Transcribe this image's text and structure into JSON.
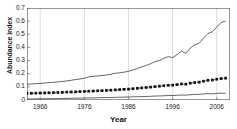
{
  "chart_data": {
    "type": "line",
    "title": "",
    "xlabel": "Year",
    "ylabel": "Abundance index",
    "xlim": [
      1963,
      2009
    ],
    "ylim": [
      0,
      0.7
    ],
    "grid": "vertical-faint",
    "legend": "none",
    "yticks": [
      0,
      0.1,
      0.2,
      0.3,
      0.4,
      0.5,
      0.6,
      0.7
    ],
    "ytick_labels": [
      "0",
      "0.1",
      "0.2",
      "0.3",
      "0.4",
      "0.5",
      "0.6",
      "0.7"
    ],
    "xticks": [
      1966,
      1976,
      1986,
      1996,
      2006
    ],
    "xtick_labels": [
      "1966",
      "1976",
      "1986",
      "1996",
      "2006"
    ],
    "x": [
      1963,
      1964,
      1965,
      1966,
      1967,
      1968,
      1969,
      1970,
      1971,
      1972,
      1973,
      1974,
      1975,
      1976,
      1977,
      1978,
      1979,
      1980,
      1981,
      1982,
      1983,
      1984,
      1985,
      1986,
      1987,
      1988,
      1989,
      1990,
      1991,
      1992,
      1993,
      1994,
      1995,
      1996,
      1997,
      1998,
      1999,
      2000,
      2001,
      2002,
      2003,
      2004,
      2005,
      2006,
      2007,
      2008
    ],
    "series": [
      {
        "name": "upper-confidence-line",
        "style": "thin-solid-line",
        "color": "#3d3d3d",
        "values": [
          0.12,
          0.122,
          0.124,
          0.126,
          0.129,
          0.132,
          0.135,
          0.138,
          0.141,
          0.145,
          0.15,
          0.156,
          0.16,
          0.165,
          0.176,
          0.18,
          0.183,
          0.186,
          0.19,
          0.196,
          0.203,
          0.207,
          0.212,
          0.218,
          0.228,
          0.24,
          0.252,
          0.263,
          0.276,
          0.292,
          0.3,
          0.318,
          0.33,
          0.322,
          0.345,
          0.372,
          0.355,
          0.395,
          0.42,
          0.432,
          0.47,
          0.505,
          0.52,
          0.555,
          0.59,
          0.6
        ]
      },
      {
        "name": "abundance-index-mean",
        "style": "square-markers-dotted",
        "color": "#111111",
        "values": [
          0.05,
          0.051,
          0.052,
          0.053,
          0.054,
          0.055,
          0.056,
          0.057,
          0.058,
          0.06,
          0.061,
          0.062,
          0.064,
          0.065,
          0.067,
          0.068,
          0.07,
          0.071,
          0.073,
          0.075,
          0.077,
          0.079,
          0.081,
          0.083,
          0.086,
          0.089,
          0.092,
          0.095,
          0.098,
          0.102,
          0.105,
          0.109,
          0.112,
          0.113,
          0.117,
          0.122,
          0.12,
          0.128,
          0.133,
          0.136,
          0.143,
          0.15,
          0.152,
          0.158,
          0.163,
          0.166
        ]
      },
      {
        "name": "lower-confidence-line",
        "style": "thin-solid-line",
        "color": "#3d3d3d",
        "values": [
          0.008,
          0.008,
          0.009,
          0.009,
          0.01,
          0.01,
          0.011,
          0.011,
          0.012,
          0.012,
          0.013,
          0.014,
          0.014,
          0.015,
          0.016,
          0.016,
          0.017,
          0.018,
          0.019,
          0.019,
          0.02,
          0.021,
          0.022,
          0.023,
          0.024,
          0.025,
          0.026,
          0.027,
          0.028,
          0.03,
          0.031,
          0.032,
          0.034,
          0.034,
          0.036,
          0.038,
          0.037,
          0.04,
          0.042,
          0.043,
          0.046,
          0.048,
          0.047,
          0.05,
          0.052,
          0.051
        ]
      }
    ]
  }
}
